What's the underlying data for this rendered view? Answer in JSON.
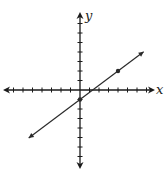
{
  "chart_data": {
    "type": "line",
    "title": "",
    "xlabel": "x",
    "ylabel": "y",
    "xlim": [
      -7,
      7
    ],
    "ylim": [
      -7,
      7
    ],
    "tick_interval": 1,
    "grid": false,
    "tick_labels": false,
    "series": [
      {
        "name": "line",
        "equation": "y = 0.75x - 1",
        "slope": 0.75,
        "intercept": -1,
        "endpoints": [
          [
            -5.4,
            -5.05
          ],
          [
            6.7,
            4.0
          ]
        ],
        "marked_points": [
          [
            0,
            -1
          ],
          [
            4,
            2
          ]
        ]
      }
    ]
  },
  "labels": {
    "x_axis": "x",
    "y_axis": "y",
    "cutoff_fragment": "y"
  },
  "colors": {
    "line": "#2a2a2a",
    "axis": "#1a1a1a"
  }
}
